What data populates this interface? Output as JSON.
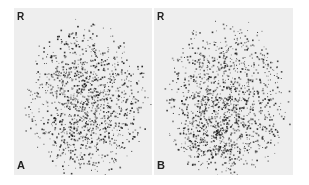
{
  "figure": {
    "panels": [
      {
        "id": "A",
        "orientation_label": "R",
        "panel_label": "A",
        "description": "Scintigraphic image with diffuse, fairly uniform speckled uptake in an oval region",
        "hotspot": {
          "cx": 0.55,
          "cy": 0.62,
          "strength": 0.25
        },
        "seed": 7
      },
      {
        "id": "B",
        "orientation_label": "R",
        "panel_label": "B",
        "description": "Scintigraphic image with speckled uptake and a dense focal concentration in the lower-central region",
        "hotspot": {
          "cx": 0.42,
          "cy": 0.72,
          "strength": 0.75
        },
        "seed": 13
      }
    ],
    "colors": {
      "background": "#ffffff",
      "panel_background": "#eeeeee",
      "dot": "#1a1a1a",
      "label": "#222222"
    }
  }
}
